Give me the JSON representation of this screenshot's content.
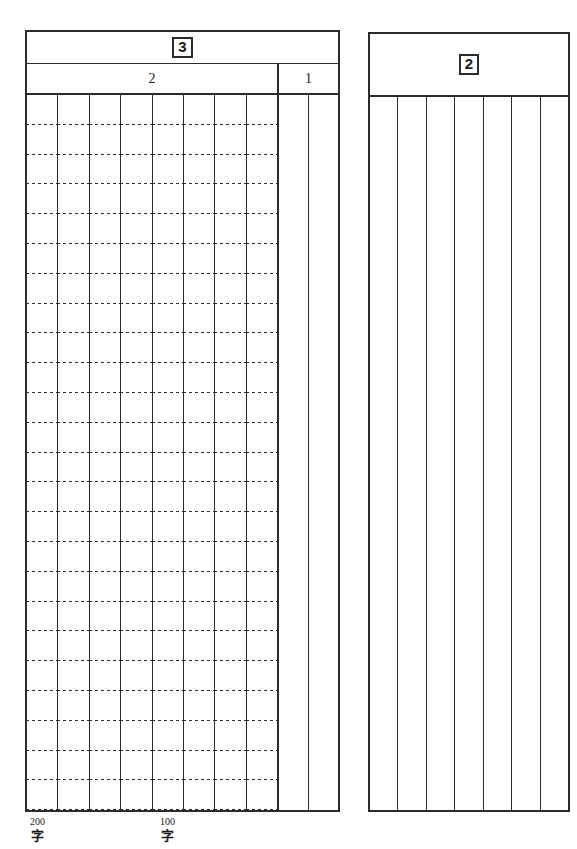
{
  "document": {
    "kind": "japanese-manuscript-answer-sheet",
    "background_color": "#ffffff",
    "ink_color": "#2b2b2b"
  },
  "left_sheet": {
    "title": "3",
    "subsections": [
      {
        "label": "2",
        "columns": 8,
        "ruled": true
      },
      {
        "label": "1",
        "columns": 2,
        "ruled": false
      }
    ]
  },
  "right_sheet": {
    "title": "2",
    "columns": 7,
    "ruled": false
  },
  "count_markers": [
    {
      "number": "200",
      "unit": "字"
    },
    {
      "number": "100",
      "unit": "字"
    }
  ]
}
